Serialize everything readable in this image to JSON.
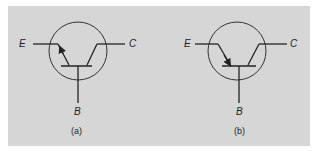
{
  "figure": {
    "background_color": "#d6d6d6",
    "line_color": "#222222",
    "panels": [
      {
        "id": "a",
        "caption": "(a)",
        "terminals": {
          "emitter": "E",
          "collector": "C",
          "base": "B"
        },
        "arrow_direction": "outward"
      },
      {
        "id": "b",
        "caption": "(b)",
        "terminals": {
          "emitter": "E",
          "collector": "C",
          "base": "B"
        },
        "arrow_direction": "inward"
      }
    ]
  }
}
